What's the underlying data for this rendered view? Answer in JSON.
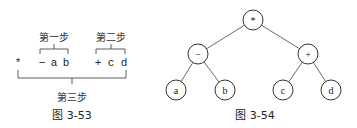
{
  "figure_left": {
    "caption": "图 3-53",
    "tokens": [
      {
        "text": "*",
        "x": 18
      },
      {
        "text": "−",
        "x": 42
      },
      {
        "text": "a",
        "x": 54
      },
      {
        "text": "b",
        "x": 66
      },
      {
        "text": "+",
        "x": 98
      },
      {
        "text": "c",
        "x": 111
      },
      {
        "text": "d",
        "x": 124
      }
    ],
    "step1": "第一步",
    "step2": "第二步",
    "step3": "第三步"
  },
  "figure_right": {
    "caption": "图 3-54",
    "nodes": {
      "root": "*",
      "left": "−",
      "right": "+",
      "ll": "a",
      "lr": "b",
      "rl": "c",
      "rr": "d"
    }
  },
  "colors": {
    "stroke": "#333333",
    "text": "#222222",
    "background": "#ffffff"
  }
}
